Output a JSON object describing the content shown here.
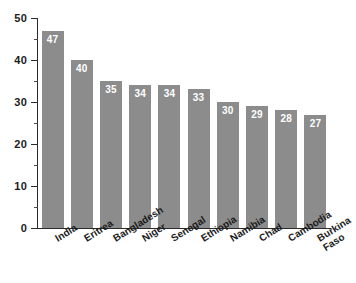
{
  "chart_data": {
    "type": "bar",
    "title": "",
    "subtitle": "",
    "xlabel": "",
    "ylabel": "",
    "ylim": [
      0,
      50
    ],
    "xlim": null,
    "grid": false,
    "legend": null,
    "orientation": "vertical",
    "bar_color": "#8c8c8c",
    "value_label_color": "#ffffff",
    "axis_color": "#2b2b2b",
    "background": "#ffffff",
    "value_labels_inside": true,
    "categories": [
      "India",
      "Eritrea",
      "Bangladesh",
      "Niger",
      "Senegal",
      "Ethiopia",
      "Namibia",
      "Chad",
      "Cambodia",
      "Burkina Faso"
    ],
    "category_lines": [
      [
        "India"
      ],
      [
        "Eritrea"
      ],
      [
        "Bangladesh"
      ],
      [
        "Niger"
      ],
      [
        "Senegal"
      ],
      [
        "Ethiopia"
      ],
      [
        "Namibia"
      ],
      [
        "Chad"
      ],
      [
        "Cambodia"
      ],
      [
        "Burkina",
        "Faso"
      ]
    ],
    "values": [
      47,
      40,
      35,
      34,
      34,
      33,
      30,
      29,
      28,
      27
    ],
    "yticks": [
      0,
      10,
      20,
      30,
      40,
      50
    ],
    "ytick_labels": [
      "0",
      "10",
      "20",
      "30",
      "40",
      "50"
    ],
    "yticks_minor": [
      5,
      15,
      25,
      35,
      45
    ],
    "xtick_rotation_deg": -32
  }
}
